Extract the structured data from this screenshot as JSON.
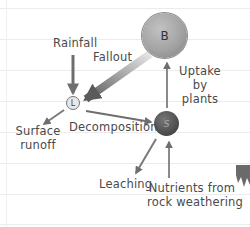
{
  "diagram": {
    "type": "nutrient cycle flow diagram",
    "nodes": [
      {
        "id": "B",
        "label": "B"
      },
      {
        "id": "S",
        "label": "S"
      },
      {
        "id": "L",
        "label": "L"
      }
    ],
    "edges": [
      {
        "from": "external",
        "to": "L",
        "label": "Rainfall"
      },
      {
        "from": "external",
        "to": "L",
        "label": "Fallout"
      },
      {
        "from": "L",
        "to": "external",
        "label": "Surface runoff"
      },
      {
        "from": "L",
        "to": "S",
        "label": "Decomposition"
      },
      {
        "from": "S",
        "to": "B",
        "label": "Uptake by plants"
      },
      {
        "from": "S",
        "to": "external",
        "label": "Leaching"
      },
      {
        "from": "external",
        "to": "S",
        "label": "Nutrients from rock weathering"
      }
    ],
    "labels": {
      "rainfall": "Rainfall",
      "fallout": "Fallout",
      "uptake_line1": "Uptake",
      "uptake_line2": "by",
      "uptake_line3": "plants",
      "surface_line1": "Surface",
      "surface_line2": "runoff",
      "decomposition": "Decomposition",
      "leaching": "Leaching",
      "nutrients_line1": "Nutrients from",
      "nutrients_line2": "rock weathering"
    },
    "colors": {
      "arrow": "#6e6e6e",
      "text": "#4a4a4a",
      "node_b": "#a3a3a3",
      "node_s": "#4f4f4f",
      "node_l": "#e8e8e8"
    }
  }
}
